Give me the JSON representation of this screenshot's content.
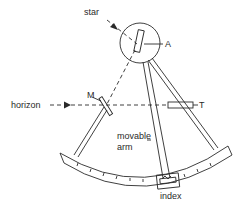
{
  "diagram": {
    "labels": {
      "star": "star",
      "index_mirror": "A",
      "horizon_mirror": "M",
      "horizon": "horizon",
      "telescope": "T",
      "movable_arm_line1": "movable",
      "movable_arm_line2": "arm",
      "index": "index"
    },
    "colors": {
      "line": "#2a2a2a",
      "background": "#ffffff"
    }
  }
}
